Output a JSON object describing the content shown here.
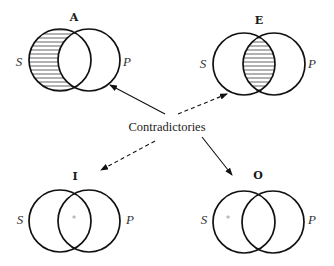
{
  "diagram": {
    "center_label": "Contradictories",
    "colors": {
      "stroke": "#111111",
      "hatch": "#222222",
      "star": "#9a9a9a",
      "background": "#ffffff"
    },
    "propositions": [
      {
        "id": "A",
        "label": "A",
        "subject": "S",
        "predicate": "P",
        "shaded_region": "S-only",
        "star_region": null
      },
      {
        "id": "E",
        "label": "E",
        "subject": "S",
        "predicate": "P",
        "shaded_region": "S-and-P",
        "star_region": null
      },
      {
        "id": "I",
        "label": "I",
        "subject": "S",
        "predicate": "P",
        "shaded_region": null,
        "star_region": "S-and-P",
        "star": "*"
      },
      {
        "id": "O",
        "label": "O",
        "subject": "S",
        "predicate": "P",
        "shaded_region": null,
        "star_region": "S-only",
        "star": "*"
      }
    ],
    "arrows": [
      {
        "from": "center",
        "to": "A",
        "style": "solid"
      },
      {
        "from": "center",
        "to": "O",
        "style": "solid"
      },
      {
        "from": "center",
        "to": "E",
        "style": "dashed"
      },
      {
        "from": "center",
        "to": "I",
        "style": "dashed"
      }
    ]
  }
}
